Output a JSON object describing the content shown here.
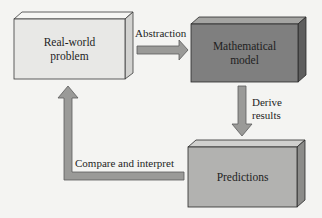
{
  "diagram": {
    "nodes": [
      {
        "id": "real_world",
        "label_line1": "Real-world",
        "label_line2": "problem",
        "fill": "#e8e8e6"
      },
      {
        "id": "math_model",
        "label_line1": "Mathematical",
        "label_line2": "model",
        "fill": "#7f7f7f"
      },
      {
        "id": "predictions",
        "label": "Predictions",
        "fill": "#b2b2b0"
      }
    ],
    "edges": [
      {
        "from": "real_world",
        "to": "math_model",
        "label": "Abstraction"
      },
      {
        "from": "math_model",
        "to": "predictions",
        "label_line1": "Derive",
        "label_line2": "results"
      },
      {
        "from": "predictions",
        "to": "real_world",
        "label": "Compare and interpret"
      }
    ],
    "colors": {
      "arrow_fill": "#9a9a98",
      "arrow_stroke": "#5a5a5a",
      "box_stroke": "#3a3a3a",
      "background": "#f4f4f2"
    }
  }
}
